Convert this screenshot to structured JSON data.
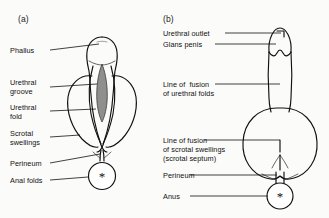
{
  "figure": {
    "background_color": "#fbfbfa",
    "line_color": "#111111",
    "groove_fill_color": "#8f8f8f"
  },
  "panels": [
    {
      "key": "a",
      "letter": "(a)",
      "caption": "Indifferent stage of external genitalia",
      "labels": [
        {
          "name": "phallus",
          "text": "Phallus"
        },
        {
          "name": "urethral-groove",
          "line1": "Urethral",
          "line2": "groove"
        },
        {
          "name": "urethral-fold",
          "line1": "Urethral",
          "line2": "fold"
        },
        {
          "name": "scrotal-swellings",
          "line1": "Scrotal",
          "line2": "swellings"
        },
        {
          "name": "perineum",
          "text": "Perineum"
        },
        {
          "name": "anal-folds",
          "text": "Anal folds"
        }
      ],
      "marker": {
        "name": "anus-asterisk",
        "glyph": "*"
      }
    },
    {
      "key": "b",
      "letter": "(b)",
      "caption": "Male external genitalia after fusion",
      "labels": [
        {
          "name": "urethral-outlet",
          "text": "Urethral outlet"
        },
        {
          "name": "glans-penis",
          "text": "Glans penis"
        },
        {
          "name": "line-of-fusion-urethral-folds",
          "line1": "Line of  fusion",
          "line2": "of urethral folds"
        },
        {
          "name": "line-of-fusion-scrotal-swellings",
          "line1": "Line of fusion",
          "line2": "of scrotal swellings",
          "line3": "(scrotal septum)"
        },
        {
          "name": "perineum",
          "text": "Perineum"
        },
        {
          "name": "anus",
          "text": "Anus"
        }
      ],
      "marker": {
        "name": "anus-asterisk",
        "glyph": "*"
      }
    }
  ]
}
